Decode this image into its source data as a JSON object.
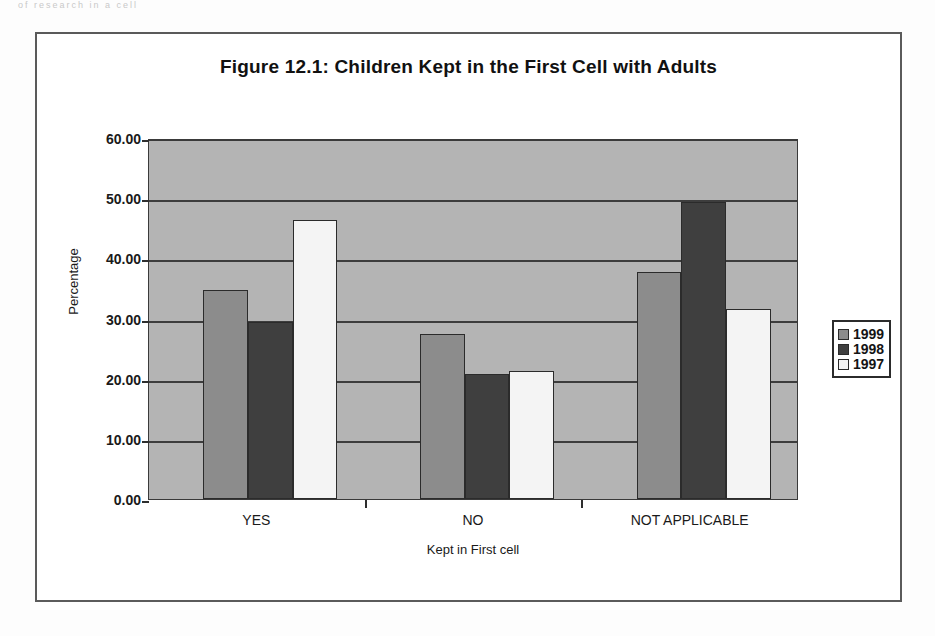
{
  "page": {
    "top_artifact_text": "of research in a cell"
  },
  "figure": {
    "title": "Figure 12.1: Children Kept in the First Cell with Adults"
  },
  "chart_data": {
    "type": "bar",
    "title": "Figure 12.1: Children Kept in the First Cell with Adults",
    "xlabel": "Kept in First cell",
    "ylabel": "Percentage",
    "categories": [
      "YES",
      "NO",
      "NOT APPLICABLE"
    ],
    "series": [
      {
        "name": "1999",
        "color": "#8c8c8c",
        "values": [
          34.8,
          27.4,
          37.7
        ]
      },
      {
        "name": "1998",
        "color": "#3f3f3f",
        "values": [
          29.4,
          20.7,
          49.4
        ]
      },
      {
        "name": "1997",
        "color": "#f4f4f4",
        "values": [
          46.4,
          21.3,
          31.6
        ]
      }
    ],
    "ylim": [
      0,
      60
    ],
    "yticks": [
      "0.00",
      "10.00",
      "20.00",
      "30.00",
      "40.00",
      "50.00",
      "60.00"
    ],
    "ytick_values": [
      0,
      10,
      20,
      30,
      40,
      50,
      60
    ],
    "grid": true,
    "legend_position": "right",
    "plot_background": "#b4b4b4"
  }
}
